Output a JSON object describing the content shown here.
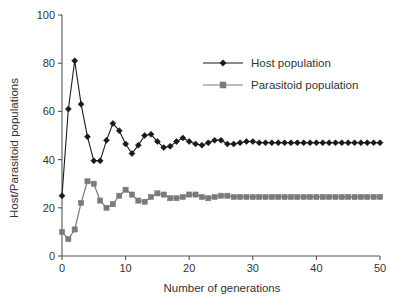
{
  "chart_data": {
    "type": "line",
    "title": "",
    "xlabel": "Number of generations",
    "ylabel": "Host/Parasitoid populations",
    "xlim": [
      0,
      50
    ],
    "ylim": [
      0,
      100
    ],
    "xticks": [
      0,
      10,
      20,
      30,
      40,
      50
    ],
    "yticks": [
      0,
      20,
      40,
      60,
      80,
      100
    ],
    "grid": false,
    "legend_position": "upper right",
    "x": [
      0,
      1,
      2,
      3,
      4,
      5,
      6,
      7,
      8,
      9,
      10,
      11,
      12,
      13,
      14,
      15,
      16,
      17,
      18,
      19,
      20,
      21,
      22,
      23,
      24,
      25,
      26,
      27,
      28,
      29,
      30,
      31,
      32,
      33,
      34,
      35,
      36,
      37,
      38,
      39,
      40,
      41,
      42,
      43,
      44,
      45,
      46,
      47,
      48,
      49,
      50
    ],
    "series": [
      {
        "name": "Host population",
        "color": "#1a1a1a",
        "marker": "diamond",
        "values": [
          25,
          61,
          81,
          63,
          49.5,
          39.5,
          39.5,
          48,
          55,
          52,
          46.5,
          42.5,
          46,
          50,
          50.5,
          47.5,
          45,
          45.5,
          47.5,
          49,
          47.5,
          46.5,
          46,
          47,
          48,
          48,
          46.5,
          46.5,
          47,
          47.5,
          47.5,
          47,
          47,
          47,
          47,
          47,
          47,
          47,
          47,
          47,
          47,
          47,
          47,
          47,
          47,
          47,
          47,
          47,
          47,
          47,
          47
        ]
      },
      {
        "name": "Parasitoid population",
        "color": "#7a7a7a",
        "marker": "square",
        "values": [
          10,
          7,
          11,
          22,
          31,
          30,
          23,
          20,
          21.5,
          25,
          27.5,
          25.5,
          23,
          22.5,
          24.5,
          26,
          25.5,
          24,
          24,
          24.5,
          25.5,
          25.5,
          24.5,
          24,
          24.5,
          25,
          25,
          24.5,
          24.5,
          24.5,
          24.5,
          24.5,
          24.5,
          24.5,
          24.5,
          24.5,
          24.5,
          24.5,
          24.5,
          24.5,
          24.5,
          24.5,
          24.5,
          24.5,
          24.5,
          24.5,
          24.5,
          24.5,
          24.5,
          24.5,
          24.5
        ]
      }
    ]
  },
  "legend": {
    "entries": [
      {
        "label": "Host population"
      },
      {
        "label": "Parasitoid population"
      }
    ]
  },
  "axes": {
    "x_title": "Number of generations",
    "y_title": "Host/Parasitoid populations",
    "x_tick_labels": [
      "0",
      "10",
      "20",
      "30",
      "40",
      "50"
    ],
    "y_tick_labels": [
      "0",
      "20",
      "40",
      "60",
      "80",
      "100"
    ]
  }
}
